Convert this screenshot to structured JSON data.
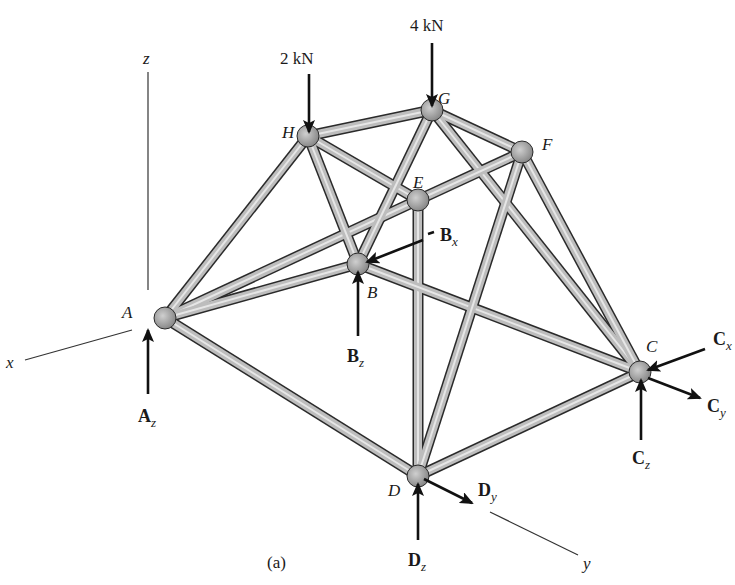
{
  "figure": {
    "caption": "(a)",
    "type": "space truss free-body diagram",
    "axes": {
      "x": "x",
      "y": "y",
      "z": "z"
    },
    "joints": [
      {
        "id": "A",
        "x": 165,
        "y": 318
      },
      {
        "id": "B",
        "x": 358,
        "y": 264
      },
      {
        "id": "C",
        "x": 640,
        "y": 372
      },
      {
        "id": "D",
        "x": 418,
        "y": 476
      },
      {
        "id": "E",
        "x": 418,
        "y": 200
      },
      {
        "id": "F",
        "x": 522,
        "y": 152
      },
      {
        "id": "G",
        "x": 432,
        "y": 110
      },
      {
        "id": "H",
        "x": 308,
        "y": 136
      }
    ],
    "members": [
      [
        "A",
        "H"
      ],
      [
        "A",
        "E"
      ],
      [
        "A",
        "B"
      ],
      [
        "A",
        "D"
      ],
      [
        "H",
        "G"
      ],
      [
        "H",
        "E"
      ],
      [
        "H",
        "B"
      ],
      [
        "G",
        "B"
      ],
      [
        "G",
        "F"
      ],
      [
        "G",
        "C"
      ],
      [
        "E",
        "F"
      ],
      [
        "E",
        "D"
      ],
      [
        "B",
        "C"
      ],
      [
        "F",
        "D"
      ],
      [
        "F",
        "C"
      ],
      [
        "D",
        "C"
      ]
    ],
    "loads": [
      {
        "label": "2 kN",
        "joint": "H"
      },
      {
        "label": "4 kN",
        "joint": "G"
      }
    ],
    "reactions": {
      "Az": {
        "main": "A",
        "sub": "z"
      },
      "Bx": {
        "main": "B",
        "sub": "x"
      },
      "Bz": {
        "main": "B",
        "sub": "z"
      },
      "Cx": {
        "main": "C",
        "sub": "x"
      },
      "Cy": {
        "main": "C",
        "sub": "y"
      },
      "Cz": {
        "main": "C",
        "sub": "z"
      },
      "Dy": {
        "main": "D",
        "sub": "y"
      },
      "Dz": {
        "main": "D",
        "sub": "z"
      }
    },
    "colors": {
      "tube": "#bdbdbd",
      "tube_edge": "#2a2a2a",
      "joint": "#8f8f8f",
      "ink": "#111111"
    }
  }
}
